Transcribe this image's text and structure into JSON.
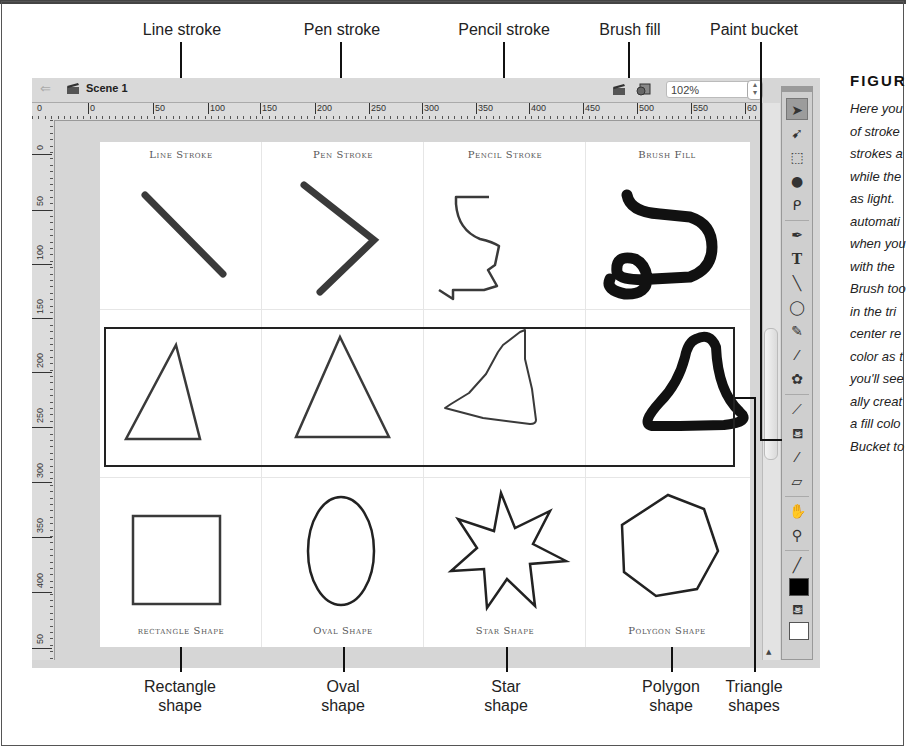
{
  "callouts_top": [
    {
      "label": "Line stroke"
    },
    {
      "label": "Pen stroke"
    },
    {
      "label": "Pencil stroke"
    },
    {
      "label": "Brush fill"
    },
    {
      "label": "Paint bucket"
    }
  ],
  "callouts_bottom": [
    {
      "line1": "Rectangle",
      "line2": "shape"
    },
    {
      "line1": "Oval",
      "line2": "shape"
    },
    {
      "line1": "Star",
      "line2": "shape"
    },
    {
      "line1": "Polygon",
      "line2": "shape"
    },
    {
      "line1": "Triangle",
      "line2": "shapes"
    }
  ],
  "figure": {
    "title": "FIGUR",
    "caption_lines": [
      "Here you",
      "of stroke",
      "strokes a",
      "while the",
      "as light.",
      "automati",
      "when you",
      "with the",
      "Brush too",
      "in the tri",
      "center re",
      "color as t",
      "you'll see",
      "ally creat",
      "a fill colo",
      "Bucket to"
    ]
  },
  "app": {
    "scene_label": "Scene 1",
    "zoom_value": "102%",
    "hruler_ticks": [
      "0",
      "0",
      "50",
      "100",
      "150",
      "200",
      "250",
      "300",
      "350",
      "400",
      "450",
      "500",
      "550",
      "60"
    ],
    "vruler_ticks": [
      "0",
      "50",
      "100",
      "150",
      "200",
      "250",
      "300",
      "350",
      "400",
      "50"
    ],
    "stage_labels": {
      "line_stroke": "Line Stroke",
      "pen_stroke": "Pen Stroke",
      "pencil_stroke": "Pencil Stroke",
      "brush_fill": "Brush Fill",
      "rectangle_shape": "rectangle Shape",
      "oval_shape": "Oval Shape",
      "star_shape": "Star Shape",
      "polygon_shape": "Polygon Shape"
    },
    "tools": [
      {
        "name": "selection-tool",
        "glyph": "➤"
      },
      {
        "name": "subselection-tool",
        "glyph": "➹"
      },
      {
        "name": "free-transform-tool",
        "glyph": "⬚"
      },
      {
        "name": "3d-rotation-tool",
        "glyph": "●"
      },
      {
        "name": "lasso-tool",
        "glyph": "ᑭ"
      },
      {
        "name": "pen-tool",
        "glyph": "✒"
      },
      {
        "name": "text-tool",
        "glyph": "T"
      },
      {
        "name": "line-tool",
        "glyph": "╲"
      },
      {
        "name": "oval-tool",
        "glyph": "◯"
      },
      {
        "name": "pencil-tool",
        "glyph": "✎"
      },
      {
        "name": "brush-tool",
        "glyph": "⁄"
      },
      {
        "name": "deco-tool",
        "glyph": "✿"
      },
      {
        "name": "bone-tool",
        "glyph": "⟋"
      },
      {
        "name": "paint-bucket-tool",
        "glyph": "⛾"
      },
      {
        "name": "eyedropper-tool",
        "glyph": "⁄"
      },
      {
        "name": "eraser-tool",
        "glyph": "▱"
      },
      {
        "name": "hand-tool",
        "glyph": "✋"
      },
      {
        "name": "zoom-tool",
        "glyph": "⚲"
      },
      {
        "name": "stroke-color-tool",
        "glyph": "╱"
      },
      {
        "name": "fill-color-tool",
        "glyph": "⛾"
      }
    ],
    "colors": {
      "stroke_swatch": "#000000",
      "fill_swatch": "#ffffff"
    }
  }
}
